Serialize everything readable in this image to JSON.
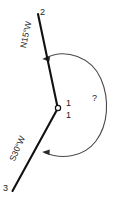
{
  "diagram": {
    "type": "surveying-bearing-angle-diagram",
    "title": "",
    "colors": {
      "line": "#111111",
      "arc": "#4a4a4a",
      "text": "#1a1a1a",
      "background": "#ffffff"
    },
    "points": [
      {
        "id": "point-2",
        "label": "2",
        "x": 38,
        "y": 12
      },
      {
        "id": "station-1",
        "label": "1",
        "x": 58,
        "y": 108
      },
      {
        "id": "point-3",
        "label": "3",
        "x": 12,
        "y": 193
      }
    ],
    "station_labels": [
      {
        "id": "station-1-upper",
        "label": "1"
      },
      {
        "id": "station-1-lower",
        "label": "1"
      }
    ],
    "lines": [
      {
        "id": "line-2-1",
        "from": "2",
        "to": "1",
        "bearing": "N15°W"
      },
      {
        "id": "line-1-3",
        "from": "1",
        "to": "3",
        "bearing": "S30°W"
      }
    ],
    "bearings": {
      "top": "N15°W",
      "bottom": "S30°W"
    },
    "angle_arc": {
      "id": "reflex-angle-arc",
      "label": "?",
      "side": "right",
      "arrowheads": [
        "top-end",
        "bottom-end"
      ],
      "description": "reflex interior angle at station 1"
    }
  }
}
